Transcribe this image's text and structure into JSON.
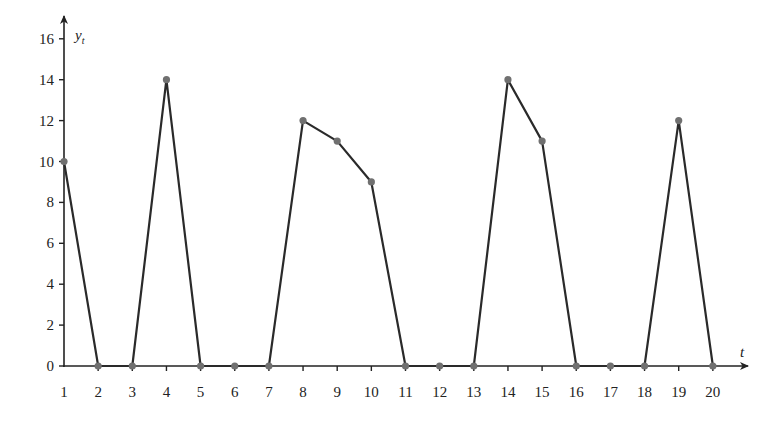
{
  "chart_data": {
    "type": "line",
    "title": "",
    "xlabel": "t",
    "ylabel": "y_t",
    "ylabel_main": "y",
    "ylabel_sub": "t",
    "x": [
      1,
      2,
      3,
      4,
      5,
      6,
      7,
      8,
      9,
      10,
      11,
      12,
      13,
      14,
      15,
      16,
      17,
      18,
      19,
      20
    ],
    "series": [
      {
        "name": "y_t",
        "values": [
          10,
          0,
          0,
          14,
          0,
          0,
          0,
          12,
          11,
          9,
          0,
          0,
          0,
          14,
          11,
          0,
          0,
          0,
          12,
          0
        ]
      }
    ],
    "x_ticks": [
      "1",
      "2",
      "3",
      "4",
      "5",
      "6",
      "7",
      "8",
      "9",
      "10",
      "11",
      "12",
      "13",
      "14",
      "15",
      "16",
      "17",
      "18",
      "19",
      "20"
    ],
    "y_ticks": [
      "0",
      "2",
      "4",
      "6",
      "8",
      "10",
      "12",
      "14",
      "16"
    ],
    "xlim": [
      1,
      21
    ],
    "ylim": [
      0,
      17
    ],
    "grid": false,
    "legend": "none",
    "markers": true,
    "colors": {
      "line": "#2a2a2a",
      "marker": "#707070",
      "axis": "#222222"
    }
  }
}
